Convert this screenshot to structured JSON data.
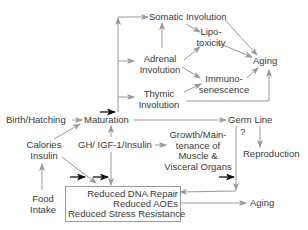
{
  "diagram": {
    "nodes": {
      "somatic_involution": "Somatic Involution",
      "lipotoxicity_1": "Lipo-",
      "lipotoxicity_2": "toxicity",
      "adrenal_1": "Adrenal",
      "adrenal_2": "Involution",
      "aging_top": "Aging",
      "immuno_1": "Immuno-",
      "immuno_2": "senescence",
      "thymic_1": "Thymic",
      "thymic_2": "Involution",
      "birth_hatching": "Birth/Hatching",
      "maturation": "Maturation",
      "germ_line": "Germ Line",
      "question": "?",
      "reproduction": "Reproduction",
      "calories_1": "Calories",
      "calories_2": "Insulin",
      "gh_igf": "GH/ IGF-1/Insulin",
      "growth_1": "Growth/Main-",
      "growth_2": "tenance of",
      "growth_3": "Muscle &",
      "growth_4": "Visceral Organs",
      "food_1": "Food",
      "food_2": "Intake",
      "reduced_1": "Reduced DNA Repair",
      "reduced_2": "Reduced AOEs",
      "reduced_3": "Reduced Stress Resistance",
      "aging_bottom": "Aging"
    }
  }
}
